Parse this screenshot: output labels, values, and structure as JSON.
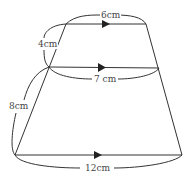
{
  "diagram": {
    "type": "trapezoid-split",
    "labels": {
      "top": "6cm",
      "middle": "7 cm",
      "bottom": "12cm",
      "upper_left_side": "4cm",
      "lower_left_side": "8cm"
    },
    "line_color": "#333333",
    "background": "#ffffff"
  }
}
